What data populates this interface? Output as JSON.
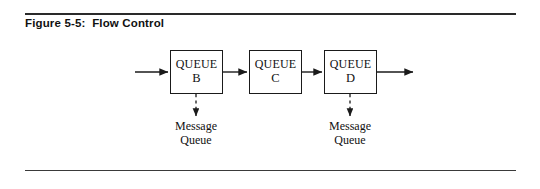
{
  "figure": {
    "caption": "Figure 5-5:  Flow Control",
    "rule_color": "#2a2a2a"
  },
  "diagram": {
    "type": "flow-diagram",
    "line_color": "#1a1a1a",
    "boxes": [
      {
        "id": "queue-b",
        "title": "QUEUE",
        "letter": "B",
        "x": 170,
        "y": 50,
        "w": 53,
        "h": 44
      },
      {
        "id": "queue-c",
        "title": "QUEUE",
        "letter": "C",
        "x": 249,
        "y": 50,
        "w": 53,
        "h": 44
      },
      {
        "id": "queue-d",
        "title": "QUEUE",
        "letter": "D",
        "x": 324,
        "y": 50,
        "w": 53,
        "h": 44
      }
    ],
    "flow_arrows": [
      {
        "id": "input-arrow",
        "from_x": 135,
        "to_x": 170,
        "y": 72
      },
      {
        "id": "arrow-b-to-c",
        "from_x": 223,
        "to_x": 249,
        "y": 72
      },
      {
        "id": "arrow-c-to-d",
        "from_x": 302,
        "to_x": 324,
        "y": 72
      },
      {
        "id": "output-arrow",
        "from_x": 377,
        "to_x": 415,
        "y": 72
      }
    ],
    "message_queues": [
      {
        "id": "message-queue-b",
        "label_line1": "Message",
        "label_line2": "Queue",
        "x": 196,
        "from_y": 94,
        "to_y": 118
      },
      {
        "id": "message-queue-d",
        "label_line1": "Message",
        "label_line2": "Queue",
        "x": 350,
        "from_y": 94,
        "to_y": 118
      }
    ]
  }
}
